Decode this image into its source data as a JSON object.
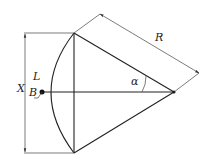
{
  "diagram": {
    "type": "geometry",
    "labels": {
      "radius": "R",
      "angle": "α",
      "arc_length": "L",
      "chord_length": "X",
      "arc_point": "B"
    },
    "colors": {
      "stroke": "#222222",
      "background": "#ffffff"
    }
  }
}
